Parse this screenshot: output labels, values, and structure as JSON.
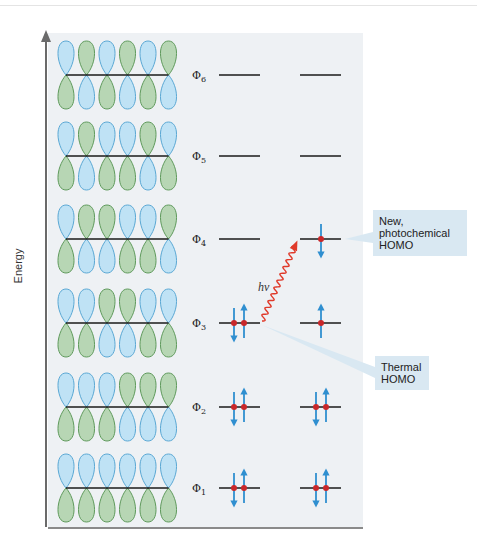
{
  "figure": {
    "axis_label": "Energy",
    "colors": {
      "lobe_blue_fill": "#bfe2f5",
      "lobe_blue_stroke": "#5aa8d4",
      "lobe_green_fill": "#b7d6b4",
      "lobe_green_stroke": "#5f9a5c",
      "electron_arrow": "#2f8fd0",
      "electron_dot": "#c8282a",
      "photon_arrow": "#e03a2a",
      "callout_bg": "#d9e8f2",
      "panel_bg": "#eef1f4"
    },
    "orbitals": [
      {
        "label": "Φ6",
        "sub": "6",
        "top": "BGBGBG",
        "bottom": "GBGBGB",
        "ground": "",
        "excited": ""
      },
      {
        "label": "Φ5",
        "sub": "5",
        "top": "BGBBGB",
        "bottom": "GBGGBG",
        "ground": "",
        "excited": ""
      },
      {
        "label": "Φ4",
        "sub": "4",
        "top": "BGGBBG",
        "bottom": "GBBGGB",
        "ground": "",
        "excited": "down"
      },
      {
        "label": "Φ3",
        "sub": "3",
        "top": "BBGGBB",
        "bottom": "GGBBGG",
        "ground": "pair",
        "excited": "up"
      },
      {
        "label": "Φ2",
        "sub": "2",
        "top": "BBBGGG",
        "bottom": "GGGBBB",
        "ground": "pair",
        "excited": "pair"
      },
      {
        "label": "Φ1",
        "sub": "1",
        "top": "BBBBBB",
        "bottom": "GGGGGG",
        "ground": "pair",
        "excited": "pair"
      }
    ],
    "photon_label": "hv",
    "callouts": {
      "new_homo": [
        "New,",
        "photochemical",
        "HOMO"
      ],
      "thermal_homo": [
        "Thermal",
        "HOMO"
      ]
    }
  }
}
